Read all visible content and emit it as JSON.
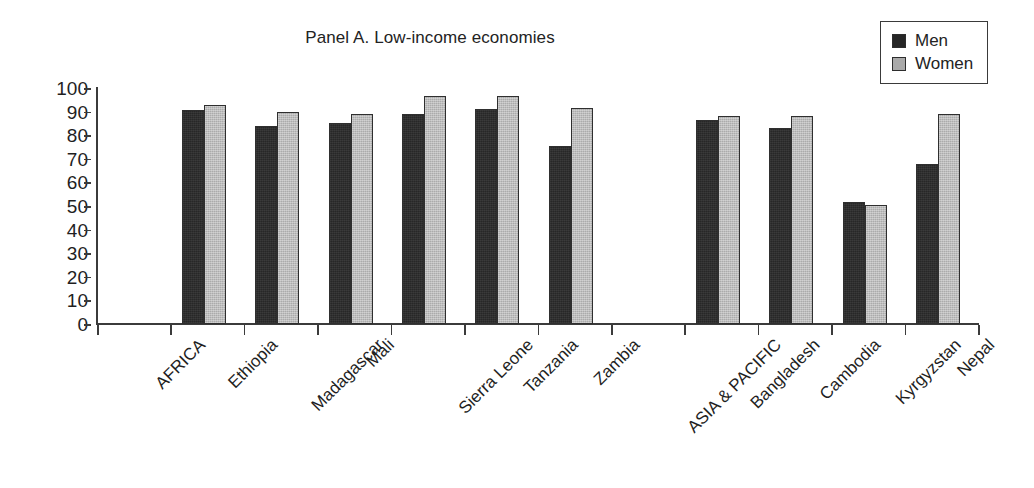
{
  "chart_data": {
    "type": "bar",
    "title": "Panel A. Low-income economies",
    "xlabel": "",
    "ylabel": "",
    "ylim": [
      0,
      100
    ],
    "yticks": [
      0,
      10,
      20,
      30,
      40,
      50,
      60,
      70,
      80,
      90,
      100
    ],
    "grid": false,
    "legend_position": "top-right",
    "categories": [
      "AFRICA",
      "Ethiopia",
      "Madagascar",
      "Mali",
      "Sierra Leone",
      "Tanzania",
      "Zambia",
      "ASIA & PACIFIC",
      "Bangladesh",
      "Cambodia",
      "Kyrgyzstan",
      "Nepal"
    ],
    "series": [
      {
        "name": "Men",
        "color": "#272727",
        "values": [
          null,
          90.5,
          84,
          85,
          89,
          91,
          75.5,
          null,
          86.5,
          83,
          51.5,
          68
        ]
      },
      {
        "name": "Women",
        "color": "#ababab",
        "values": [
          null,
          93,
          90,
          89,
          96.5,
          96.5,
          91.5,
          null,
          88,
          88,
          50.5,
          89
        ]
      }
    ]
  },
  "legend": {
    "items": [
      {
        "label": "Men",
        "swatch": "men"
      },
      {
        "label": "Women",
        "swatch": "women"
      }
    ]
  }
}
